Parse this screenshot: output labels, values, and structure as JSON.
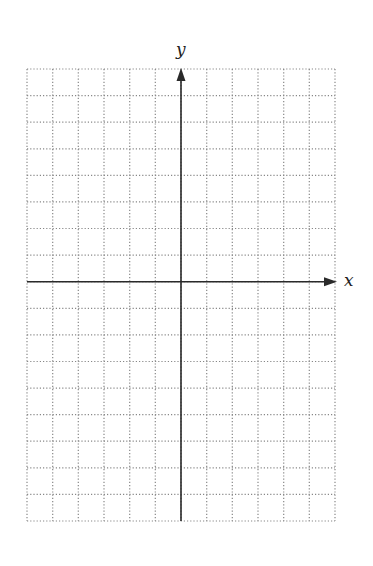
{
  "diagram": {
    "type": "coordinate-grid",
    "grid": {
      "left": 27,
      "right": 335,
      "top": 69,
      "bottom": 521,
      "columns": 12,
      "rows": 17,
      "line_style": "dotted",
      "line_color": "#888888"
    },
    "origin": {
      "x": 182,
      "y": 281,
      "col_index": 6,
      "row_index_from_top": 8
    },
    "axes": {
      "x": {
        "label": "x",
        "color": "#2a2a2a",
        "arrow": "right"
      },
      "y": {
        "label": "y",
        "color": "#2a2a2a",
        "arrow": "up"
      }
    }
  }
}
